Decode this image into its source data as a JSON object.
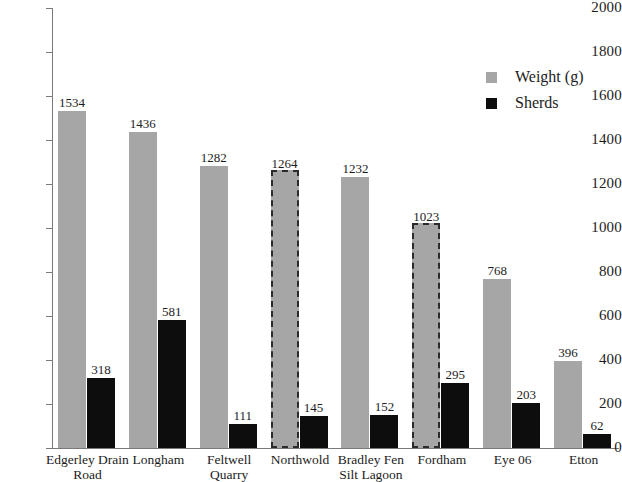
{
  "chart_data": {
    "type": "bar",
    "title": "",
    "xlabel": "",
    "ylabel": "",
    "ylim": [
      0,
      2000
    ],
    "ytick_step": 200,
    "yticks": [
      "2000",
      "1800",
      "1600",
      "1400",
      "1200",
      "1000",
      "800",
      "600",
      "400",
      "200",
      "0"
    ],
    "grid": false,
    "legend_position": "top-right",
    "categories": [
      "Edgerley Drain Road",
      "Longham",
      "Feltwell Quarry",
      "Northwold",
      "Bradley Fen Silt Lagoon",
      "Fordham",
      "Eye 06",
      "Etton"
    ],
    "category_lines": [
      [
        "Edgerley Drain",
        "Road"
      ],
      [
        "Longham"
      ],
      [
        "Feltwell",
        "Quarry"
      ],
      [
        "Northwold"
      ],
      [
        "Bradley Fen",
        "Silt Lagoon"
      ],
      [
        "Fordham"
      ],
      [
        "Eye 06"
      ],
      [
        "Etton"
      ]
    ],
    "series": [
      {
        "name": "Weight (g)",
        "color": "#a6a6a6",
        "values": [
          1534,
          1436,
          1282,
          1264,
          1232,
          1023,
          768,
          396
        ],
        "dashed_outline": [
          false,
          false,
          false,
          true,
          false,
          true,
          false,
          false
        ]
      },
      {
        "name": "Sherds",
        "color": "#0d0d0d",
        "values": [
          318,
          581,
          111,
          145,
          152,
          295,
          203,
          62
        ],
        "dashed_outline": [
          false,
          false,
          false,
          false,
          false,
          false,
          false,
          false
        ]
      }
    ]
  },
  "legend": {
    "items": [
      {
        "label": "Weight (g)",
        "swatch": "weight"
      },
      {
        "label": "Sherds",
        "swatch": "sherds"
      }
    ]
  },
  "colors": {
    "weight_bar": "#a6a6a6",
    "sherds_bar": "#0d0d0d",
    "axis": "#7a7a7a",
    "text": "#1c1c1c",
    "background": "#ffffff",
    "dash_outline": "#2b2b2b"
  }
}
